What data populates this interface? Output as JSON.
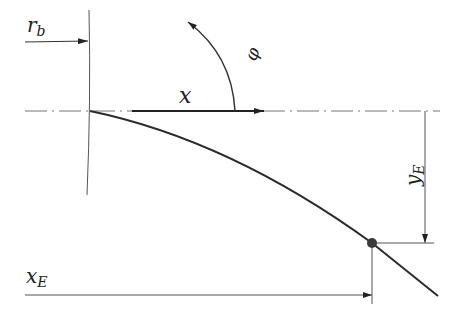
{
  "diagram": {
    "colors": {
      "line": "#333333",
      "thin": "#555555",
      "axis": "#777777",
      "point": "#3a3a3a",
      "text": "#222222"
    },
    "labels": {
      "r_b": {
        "main": "r",
        "sub": "b"
      },
      "x": {
        "main": "x"
      },
      "phi": {
        "main": "φ"
      },
      "y_E": {
        "main": "y",
        "sub": "E"
      },
      "x_E": {
        "main": "x",
        "sub": "E"
      }
    },
    "geometry": {
      "origin": [
        90,
        111
      ],
      "end_point_E": [
        372,
        243
      ],
      "curve_end": [
        438,
        296
      ],
      "axis_y": 111,
      "base_circle_x": 89
    }
  }
}
